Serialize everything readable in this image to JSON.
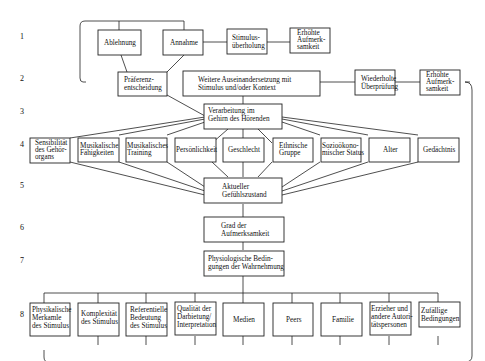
{
  "diagram": {
    "row_numbers": [
      "1",
      "2",
      "3",
      "4",
      "5",
      "6",
      "7",
      "8"
    ],
    "row1": {
      "ablehnung": "Ablehnung",
      "annahme": "Annahme",
      "stimulus": [
        "Stimulus-",
        "überholung"
      ],
      "erhoehte": [
        "Erhöhte",
        "Aufmerk-",
        "samkeit"
      ]
    },
    "row2": {
      "praeferenz": [
        "Präferenz-",
        "entscheidung"
      ],
      "weitere": [
        "Weitere Auseinandersetzung mit",
        "Stimulus und/oder Kontext"
      ],
      "wiederholte": [
        "Wiederholte",
        "Überprüfung"
      ],
      "erhoehte": [
        "Erhöhte",
        "Aufmerk-",
        "samkeit"
      ]
    },
    "row3": {
      "verarbeitung": [
        "Verarbeitung im",
        "Gehirn des Hörenden"
      ]
    },
    "row4": [
      [
        "Sensibilität",
        "des Gehör-",
        "organs"
      ],
      [
        "Musikalische",
        "Fähigkeiten"
      ],
      [
        "Musikalisches",
        "Training"
      ],
      [
        "Persönlichkeit"
      ],
      [
        "Geschlecht"
      ],
      [
        "Ethnische",
        "Gruppe"
      ],
      [
        "Sozioökono-",
        "mischer Status"
      ],
      [
        "Alter"
      ],
      [
        "Gedächtnis"
      ]
    ],
    "row5": {
      "gefuehl": [
        "Aktueller",
        "Gefühlszustand"
      ]
    },
    "row6": {
      "grad": [
        "Grad der",
        "Aufmerksamkeit"
      ]
    },
    "row7": {
      "physio": [
        "Physiologische Bedin-",
        "gungen der Wahrnehmung"
      ]
    },
    "row8": [
      [
        "Physikalische",
        "Merkamle",
        "des Stimulus"
      ],
      [
        "Komplexität",
        "des Stimulus"
      ],
      [
        "Referentielle",
        "Bedeutung",
        "des Stimulus"
      ],
      [
        "Qualität der",
        "Darbietung/",
        "Interpretation"
      ],
      [
        "Medien"
      ],
      [
        "Peers"
      ],
      [
        "Familie"
      ],
      [
        "Erzieher und",
        "andere Autori-",
        "tätspersonen"
      ],
      [
        "Zufällige",
        "Bedingungen"
      ]
    ]
  }
}
